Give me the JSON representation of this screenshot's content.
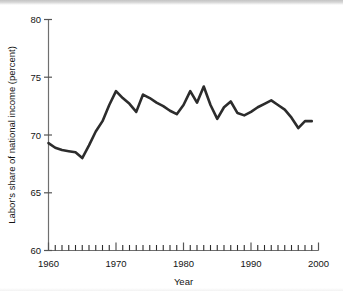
{
  "chart_data": {
    "type": "line",
    "title": "",
    "xlabel": "Year",
    "ylabel": "Labor's share of national income (percent)",
    "xlim": [
      1960,
      2000
    ],
    "ylim": [
      60,
      80
    ],
    "grid": false,
    "legend": "none",
    "x_major_ticks": [
      1960,
      1970,
      1980,
      1990,
      2000
    ],
    "x_major_tick_labels": [
      "1960",
      "1970",
      "1980",
      "1990",
      "2000"
    ],
    "x_minor_tick_step": 1,
    "y_major_ticks": [
      60,
      65,
      70,
      75,
      80
    ],
    "y_major_tick_labels": [
      "60",
      "65",
      "70",
      "75",
      "80"
    ],
    "series": [
      {
        "name": "Labor's share of national income",
        "color": "#2c2c2c",
        "x": [
          1960,
          1961,
          1962,
          1963,
          1964,
          1965,
          1966,
          1967,
          1968,
          1969,
          1970,
          1971,
          1972,
          1973,
          1974,
          1975,
          1976,
          1977,
          1978,
          1979,
          1980,
          1981,
          1982,
          1983,
          1984,
          1985,
          1986,
          1987,
          1988,
          1989,
          1990,
          1991,
          1992,
          1993,
          1994,
          1995,
          1996,
          1997,
          1998,
          1999
        ],
        "values": [
          69.3,
          68.9,
          68.7,
          68.6,
          68.5,
          68.0,
          69.1,
          70.3,
          71.2,
          72.6,
          73.8,
          73.2,
          72.7,
          72.0,
          73.5,
          73.2,
          72.8,
          72.5,
          72.1,
          71.8,
          72.6,
          73.8,
          72.8,
          74.2,
          72.6,
          71.4,
          72.4,
          72.9,
          71.9,
          71.7,
          72.0,
          72.4,
          72.7,
          73.0,
          72.6,
          72.2,
          71.5,
          70.6,
          71.2,
          71.2
        ]
      }
    ]
  },
  "figure": {
    "axis_color": "#6f6f6f",
    "line_color": "#2c2c2c",
    "background": "#ffffff"
  }
}
